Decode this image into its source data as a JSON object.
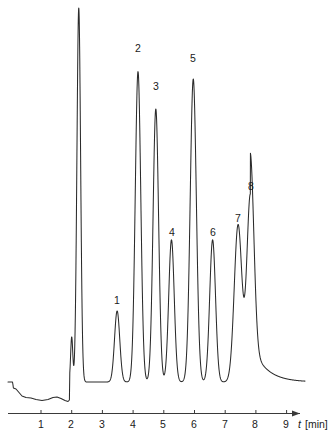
{
  "chart_data": {
    "type": "line",
    "title": "",
    "subtitle": "",
    "xlabel": "t [min]",
    "ylabel": "",
    "xlim": [
      0.0,
      9.6
    ],
    "ylim": [
      0,
      100
    ],
    "grid": false,
    "legend": null,
    "x_ticks": [
      1,
      2,
      3,
      4,
      5,
      6,
      7,
      8,
      9
    ],
    "x_tick_labels": [
      "1",
      "2",
      "3",
      "4",
      "5",
      "6",
      "7",
      "8",
      "9"
    ],
    "axis_arrow": true,
    "baseline_level": 0,
    "series": [
      {
        "name": "detector signal",
        "peaks": [
          {
            "label": "",
            "rt": 2.0,
            "height": 12,
            "width": 0.035,
            "clipped": false,
            "note": "solvent pre-spike"
          },
          {
            "label": "",
            "rt": 2.23,
            "height": 100,
            "width": 0.06,
            "clipped": true,
            "note": "off-scale solvent peak, flat top"
          },
          {
            "label": "1",
            "rt": 3.48,
            "height": 19,
            "width": 0.085,
            "clipped": false
          },
          {
            "label": "2",
            "rt": 4.16,
            "height": 83,
            "width": 0.09,
            "clipped": false
          },
          {
            "label": "3",
            "rt": 4.74,
            "height": 73,
            "width": 0.09,
            "clipped": false
          },
          {
            "label": "4",
            "rt": 5.25,
            "height": 38,
            "width": 0.09,
            "clipped": false
          },
          {
            "label": "5",
            "rt": 5.96,
            "height": 81,
            "width": 0.1,
            "clipped": false
          },
          {
            "label": "6",
            "rt": 6.59,
            "height": 38,
            "width": 0.095,
            "clipped": false
          },
          {
            "label": "7",
            "rt": 7.42,
            "height": 42,
            "width": 0.125,
            "clipped": false
          },
          {
            "label": "8",
            "rt": 7.82,
            "height": 50,
            "width": 0.115,
            "clipped": false
          }
        ],
        "peak_labels": [
          "1",
          "2",
          "3",
          "4",
          "5",
          "6",
          "7",
          "8"
        ],
        "injection_marker_rt": 0.1,
        "tail_end_rt": 9.3
      }
    ],
    "annotations": [
      {
        "text": "1",
        "rt": 3.48
      },
      {
        "text": "2",
        "rt": 4.16
      },
      {
        "text": "3",
        "rt": 4.74
      },
      {
        "text": "4",
        "rt": 5.25
      },
      {
        "text": "5",
        "rt": 5.96
      },
      {
        "text": "6",
        "rt": 6.59
      },
      {
        "text": "7",
        "rt": 7.42
      },
      {
        "text": "8",
        "rt": 7.82
      }
    ],
    "colors": {
      "trace": "#2b2b2b",
      "axis": "#3a3a3a",
      "background": "#ffffff",
      "text": "#1a1a1a"
    }
  },
  "axis": {
    "x_title_symbol": "t",
    "x_title_unit": "[min]"
  },
  "peak_labels": {
    "p1": "1",
    "p2": "2",
    "p3": "3",
    "p4": "4",
    "p5": "5",
    "p6": "6",
    "p7": "7",
    "p8": "8"
  },
  "ticks": {
    "t1": "1",
    "t2": "2",
    "t3": "3",
    "t4": "4",
    "t5": "5",
    "t6": "6",
    "t7": "7",
    "t8": "8",
    "t9": "9"
  }
}
